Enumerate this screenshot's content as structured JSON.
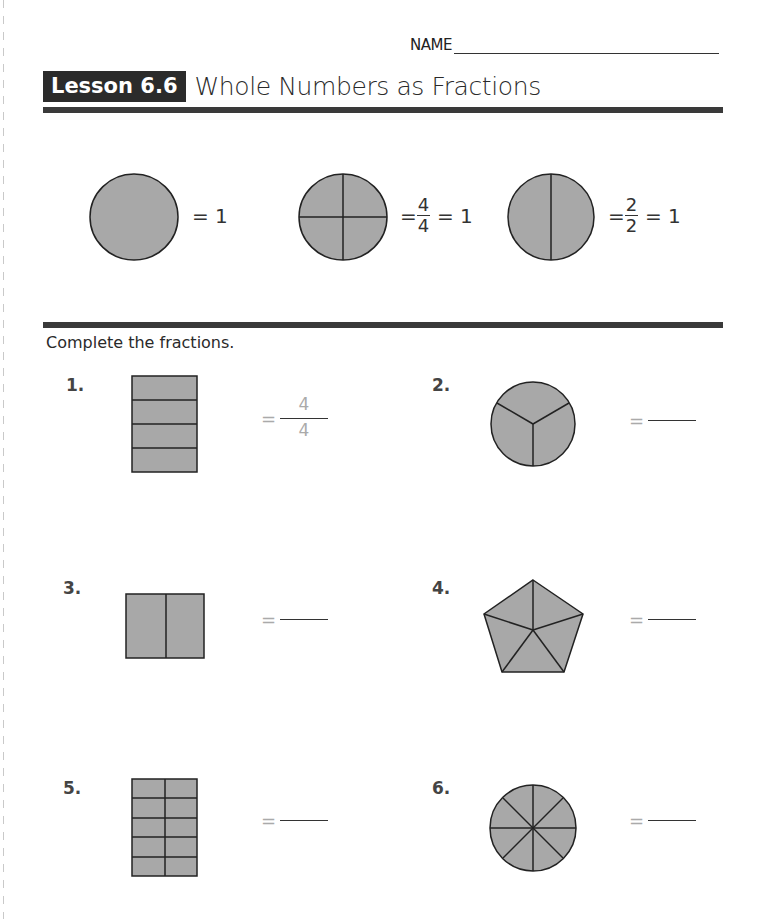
{
  "header": {
    "name_label": "NAME",
    "lesson_badge": "Lesson 6.6",
    "lesson_title": "Whole Numbers as Fractions"
  },
  "examples": [
    {
      "shape": "circle",
      "parts": 1,
      "equation": "= 1"
    },
    {
      "shape": "circle",
      "parts": 4,
      "equals": "=",
      "numerator": "4",
      "denominator": "4",
      "equation_tail": "= 1"
    },
    {
      "shape": "circle",
      "parts": 2,
      "equals": "=",
      "numerator": "2",
      "denominator": "2",
      "equation_tail": "= 1"
    }
  ],
  "instructions": "Complete the fractions.",
  "questions": [
    {
      "number": "1.",
      "shape": "rectangle",
      "parts": 4,
      "equals": "=",
      "answer_numerator": "4",
      "answer_denominator": "4"
    },
    {
      "number": "2.",
      "shape": "circle",
      "parts": 3,
      "equals": "=",
      "answer": ""
    },
    {
      "number": "3.",
      "shape": "square",
      "parts": 2,
      "equals": "=",
      "answer": ""
    },
    {
      "number": "4.",
      "shape": "pentagon",
      "parts": 5,
      "equals": "=",
      "answer": ""
    },
    {
      "number": "5.",
      "shape": "rectangle-grid",
      "parts": 10,
      "equals": "=",
      "answer": ""
    },
    {
      "number": "6.",
      "shape": "circle",
      "parts": 8,
      "equals": "=",
      "answer": ""
    }
  ],
  "colors": {
    "shape_fill": "#a8a8a8",
    "shape_stroke": "#222222",
    "badge_bg": "#2b2b2b",
    "rule": "#3a3a3a",
    "answer_gray": "#aaaaaa"
  }
}
